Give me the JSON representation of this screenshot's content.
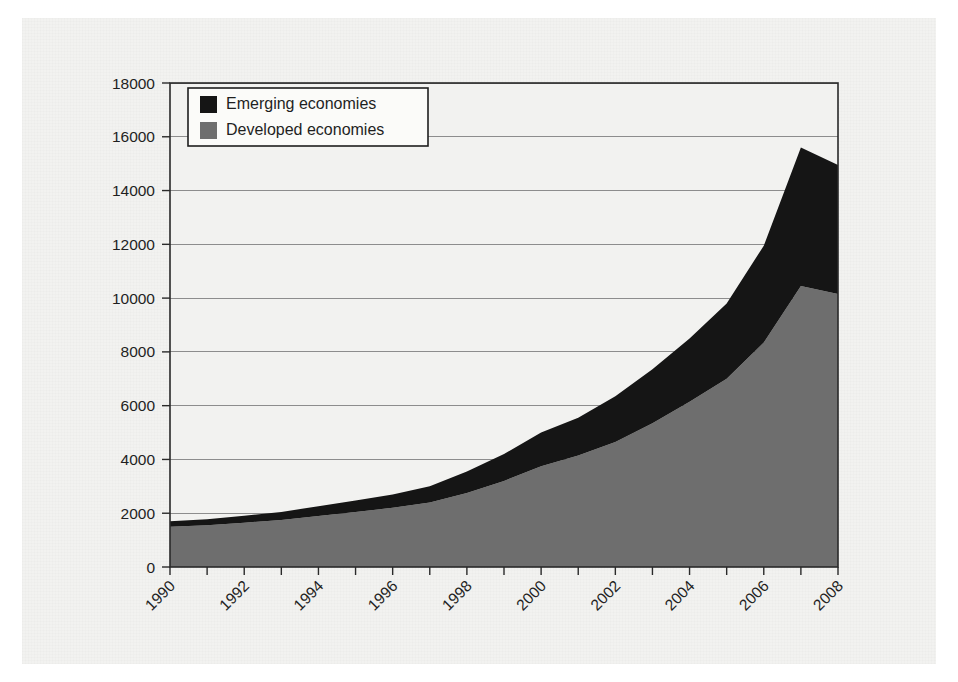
{
  "figure": {
    "background_color": "#f2f2f0",
    "plot_background_color": "#f2f2f0",
    "frame_color": "#2a2a2a"
  },
  "legend": {
    "position": "top-left-inside",
    "entries": [
      {
        "label": "Emerging economies",
        "color": "#151515",
        "swatch_name": "emerging-swatch"
      },
      {
        "label": "Developed economies",
        "color": "#6e6e6e",
        "swatch_name": "developed-swatch"
      }
    ]
  },
  "axes": {
    "y_ticks": [
      "0",
      "2000",
      "4000",
      "6000",
      "8000",
      "10000",
      "12000",
      "14000",
      "16000",
      "18000"
    ],
    "x_ticks": [
      "1990",
      "1992",
      "1994",
      "1996",
      "1998",
      "2000",
      "2002",
      "2004",
      "2006",
      "2008"
    ],
    "x_tick_rotation_degrees": -45
  },
  "chart_data": {
    "type": "area",
    "stacked": true,
    "title": "",
    "subtitle": "",
    "xlabel": "",
    "ylabel": "",
    "xlim": [
      1990,
      2008
    ],
    "ylim": [
      0,
      18000
    ],
    "ytick_interval": 2000,
    "grid": true,
    "grid_axis": "y",
    "legend_position": "upper left",
    "categories": [
      1990,
      1991,
      1992,
      1993,
      1994,
      1995,
      1996,
      1997,
      1998,
      1999,
      2000,
      2001,
      2002,
      2003,
      2004,
      2005,
      2006,
      2007,
      2008
    ],
    "series": [
      {
        "name": "Developed economies",
        "color": "#6e6e6e",
        "values": [
          1500,
          1550,
          1650,
          1750,
          1900,
          2050,
          2200,
          2400,
          2750,
          3200,
          3750,
          4150,
          4650,
          5350,
          6150,
          7000,
          8350,
          10450,
          10150
        ]
      },
      {
        "name": "Emerging economies",
        "color": "#151515",
        "values": [
          200,
          230,
          260,
          300,
          360,
          420,
          500,
          600,
          800,
          1000,
          1250,
          1400,
          1700,
          2000,
          2350,
          2800,
          3600,
          5150,
          4800
        ]
      }
    ],
    "totals": [
      1700,
      1780,
      1910,
      2050,
      2260,
      2470,
      2700,
      3000,
      3550,
      4200,
      5000,
      5550,
      6350,
      7350,
      8500,
      9800,
      11950,
      15600,
      14950
    ]
  }
}
